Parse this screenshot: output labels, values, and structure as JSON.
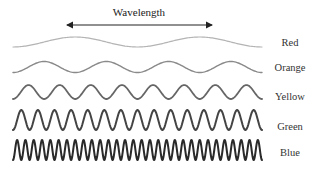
{
  "title": "Wavelength",
  "arrow": {
    "x1": 67,
    "x2": 212,
    "y": 25,
    "color": "#222222"
  },
  "waves": [
    {
      "label": "Red",
      "center_y": 42,
      "amplitude": 5,
      "cycles": 2,
      "phase": "rise",
      "color": "#b4b4b4",
      "stroke_width": 1.2,
      "label_y": 37
    },
    {
      "label": "Orange",
      "center_y": 67,
      "amplitude": 5.5,
      "cycles": 4,
      "phase": "rise",
      "color": "#8a8a8a",
      "stroke_width": 1.4,
      "label_y": 62
    },
    {
      "label": "Yellow",
      "center_y": 92,
      "amplitude": 7,
      "cycles": 8,
      "phase": "rise",
      "color": "#666666",
      "stroke_width": 1.8,
      "label_y": 91
    },
    {
      "label": "Green",
      "center_y": 120,
      "amplitude": 10,
      "cycles": 15,
      "phase": "rise",
      "color": "#444444",
      "stroke_width": 2.0,
      "label_y": 121
    },
    {
      "label": "Blue",
      "center_y": 150,
      "amplitude": 10,
      "cycles": 30,
      "phase": "rise",
      "color": "#2a2a2a",
      "stroke_width": 2.0,
      "label_y": 147
    }
  ],
  "wave_x_start": 13,
  "wave_x_end": 262
}
